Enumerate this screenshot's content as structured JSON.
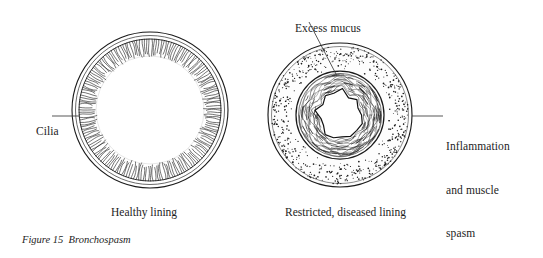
{
  "figure": {
    "caption_prefix": "Figure 15",
    "caption_title": "Bronchospasm",
    "caption_full": "Figure 15  Bronchospasm",
    "background_color": "#ffffff",
    "ink_color": "#1a1a1a"
  },
  "labels": {
    "cilia": "Cilia",
    "excess_mucus": "Excess mucus",
    "inflammation_line1": "Inflammation",
    "inflammation_line2": "and muscle",
    "inflammation_line3": "spasm"
  },
  "captions": {
    "healthy": "Healthy lining",
    "diseased": "Restricted, diseased lining"
  },
  "chart_data": {
    "type": "diagram",
    "title": "Figure 15  Bronchospasm",
    "panels": [
      {
        "id": "healthy-airway",
        "caption": "Healthy lining",
        "center": [
          150,
          110
        ],
        "outer_radius": 78,
        "wall_inner_radius": 71,
        "lumen_radius": 55,
        "features": [
          "outer wall ring",
          "inner wall ring",
          "cilia fringe",
          "wide open lumen"
        ],
        "annotations": [
          {
            "label": "Cilia",
            "target": [
              79,
              116
            ],
            "leader_from": [
              52,
              116
            ]
          }
        ]
      },
      {
        "id": "diseased-airway",
        "caption": "Restricted, diseased lining",
        "center": [
          340,
          115
        ],
        "outer_radius": 72,
        "stipple_inner_radius": 44,
        "mucus_outer_radius": 42,
        "lumen_radius": 23,
        "features": [
          "stippled inflamed wall",
          "thickened muscle ring",
          "layered excess mucus",
          "narrowed irregular lumen"
        ],
        "annotations": [
          {
            "label": "Excess mucus",
            "target": [
              335,
              73
            ],
            "leader_from": [
              309,
              22
            ]
          },
          {
            "label": "Inflammation and muscle spasm",
            "target": [
              413,
              116
            ],
            "leader_from": [
              443,
              116
            ]
          }
        ]
      }
    ]
  }
}
